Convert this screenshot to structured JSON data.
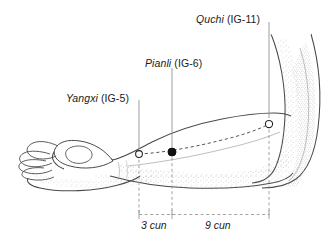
{
  "figure": {
    "background_color": "#ffffff",
    "ink_color": "#1b1b1b",
    "line_color": "#4a4a4a",
    "guide_color": "#8c8c8c",
    "stipple_color": "#9a9a9a"
  },
  "points": [
    {
      "id": "yangxi",
      "name": "Yangxi",
      "code": "(IG-5)",
      "marker": "hollow-circle",
      "x": 139,
      "y": 154
    },
    {
      "id": "pianli",
      "name": "Pianli",
      "code": "(IG-6)",
      "marker": "filled-circle",
      "x": 172,
      "y": 152
    },
    {
      "id": "quchi",
      "name": "Quchi",
      "code": "(IG-11)",
      "marker": "hollow-circle",
      "x": 269,
      "y": 124
    }
  ],
  "labels": {
    "quchi": {
      "name": "Quchi",
      "code": "(IG-11)"
    },
    "pianli": {
      "name": "Pianli",
      "code": "(IG-6)"
    },
    "yangxi": {
      "name": "Yangxi",
      "code": "(IG-5)"
    }
  },
  "measurements": [
    {
      "id": "seg-3cun",
      "label": "3 cun",
      "from_point": "yangxi",
      "to_point": "pianli"
    },
    {
      "id": "seg-9cun",
      "label": "9 cun",
      "from_point": "pianli",
      "to_point": "quchi"
    }
  ]
}
